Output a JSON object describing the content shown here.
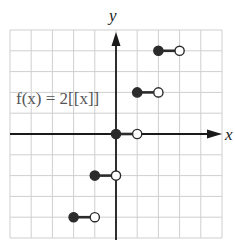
{
  "chart_data": {
    "type": "line",
    "title": "",
    "annotation": "f(x) = 2[[x]]",
    "xlabel": "x",
    "ylabel": "y",
    "xlim": [
      -5,
      5
    ],
    "ylim": [
      -5,
      5
    ],
    "grid": true,
    "tick_labels_shown": false,
    "series": [
      {
        "name": "f(x) = 2[[x]]",
        "kind": "step",
        "segments": [
          {
            "x_start": -2,
            "x_end": -1,
            "y": -4,
            "start_closed": true,
            "end_closed": false
          },
          {
            "x_start": -1,
            "x_end": 0,
            "y": -2,
            "start_closed": true,
            "end_closed": false
          },
          {
            "x_start": 0,
            "x_end": 1,
            "y": 0,
            "start_closed": true,
            "end_closed": false
          },
          {
            "x_start": 1,
            "x_end": 2,
            "y": 2,
            "start_closed": true,
            "end_closed": false
          },
          {
            "x_start": 2,
            "x_end": 3,
            "y": 4,
            "start_closed": true,
            "end_closed": false
          }
        ]
      }
    ]
  },
  "labels": {
    "x_axis": "x",
    "y_axis": "y",
    "formula": "f(x) = 2[[x]]"
  },
  "colors": {
    "grid": "#cfcfcf",
    "axis": "#1a1a1a",
    "curve": "#2b2b2b",
    "formula": "#555555"
  }
}
